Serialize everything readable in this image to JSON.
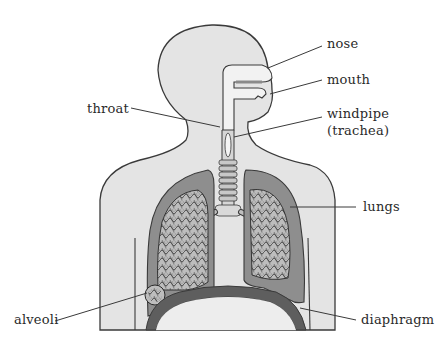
{
  "diagram": {
    "colors": {
      "background": "#ffffff",
      "body_fill": "#e4e4e4",
      "body_outline": "#3a3a3a",
      "lung_fill": "#8e8e8e",
      "lung_inner": "#cfcfcf",
      "diaphragm_fill": "#5e5e5e",
      "trachea_fill": "#d6d6d6",
      "leader_line": "#3a3a3a",
      "label_text": "#2a2a2a"
    },
    "labels": [
      {
        "id": "nose",
        "text": "nose"
      },
      {
        "id": "mouth",
        "text": "mouth"
      },
      {
        "id": "throat",
        "text": "throat"
      },
      {
        "id": "windpipe",
        "text": "windpipe"
      },
      {
        "id": "trachea",
        "text": "(trachea)"
      },
      {
        "id": "lungs",
        "text": "lungs"
      },
      {
        "id": "alveoli",
        "text": "alveoli"
      },
      {
        "id": "diaphragm",
        "text": "diaphragm"
      }
    ]
  }
}
